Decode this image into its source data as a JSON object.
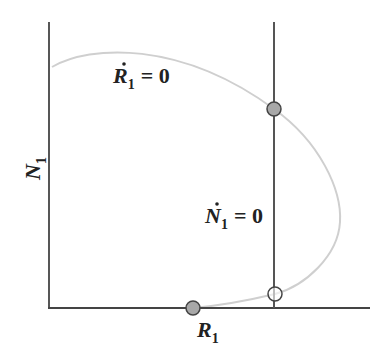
{
  "diagram": {
    "type": "phase-plane",
    "axes": {
      "x_label": "R",
      "x_label_sub": "1",
      "y_label": "N",
      "y_label_sub": "1"
    },
    "isoclines": {
      "prey": {
        "label_var": "R",
        "label_sub": "1",
        "label_rhs": "= 0",
        "shape": "hump curve",
        "color": "#c8c8c8"
      },
      "predator": {
        "label_var": "N",
        "label_sub": "1",
        "label_rhs": "= 0",
        "shape": "vertical line",
        "color": "#555555"
      }
    },
    "equilibria": [
      {
        "name": "upper-intersection",
        "style": "filled",
        "color": "#a8a8a8"
      },
      {
        "name": "lower-intersection",
        "style": "open"
      },
      {
        "name": "axis-equilibrium",
        "style": "filled",
        "color": "#a8a8a8"
      }
    ]
  }
}
